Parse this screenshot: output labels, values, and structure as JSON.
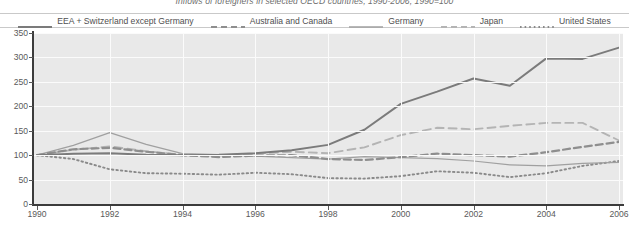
{
  "title": "Inflows of foreigners in selected OECD countries, 1990-2006, 1990=100",
  "legend": {
    "position": "top",
    "items": [
      {
        "label": "EEA + Switzerland except Germany",
        "style": "solid-thick",
        "color": "#7b7b7b"
      },
      {
        "label": "Australia and Canada",
        "style": "dashed-thick",
        "color": "#8e8e8e"
      },
      {
        "label": "Germany",
        "style": "solid-thin",
        "color": "#a0a0a0"
      },
      {
        "label": "Japan",
        "style": "dashed-light",
        "color": "#b4b4b4"
      },
      {
        "label": "United States",
        "style": "dotted",
        "color": "#8a8a8a"
      }
    ]
  },
  "axes": {
    "y_label": "",
    "y_ticks": [
      0,
      50,
      100,
      150,
      200,
      250,
      300,
      350
    ],
    "y_min": 0,
    "y_max": 350,
    "x_label": "",
    "x_ticks": [
      1990,
      1992,
      1994,
      1996,
      1998,
      2000,
      2002,
      2004,
      2006
    ],
    "x_min": 1990,
    "x_max": 2006,
    "grid": true
  },
  "chart_data": {
    "type": "line",
    "title": "Inflows of foreigners in selected OECD countries, 1990-2006, 1990=100",
    "xlabel": "",
    "ylabel": "",
    "ylim": [
      0,
      350
    ],
    "xlim": [
      1990,
      2006
    ],
    "grid": true,
    "legend_position": "top",
    "x": [
      1990,
      1991,
      1992,
      1993,
      1994,
      1995,
      1996,
      1997,
      1998,
      1999,
      2000,
      2001,
      2002,
      2003,
      2004,
      2005,
      2006
    ],
    "series": [
      {
        "name": "EEA + Switzerland except Germany",
        "style": "solid-thick",
        "color": "#7b7b7b",
        "values": [
          100,
          103,
          104,
          101,
          100,
          101,
          104,
          110,
          121,
          152,
          205,
          230,
          257,
          242,
          298,
          297,
          320
        ]
      },
      {
        "name": "Australia and Canada",
        "style": "dashed-thick",
        "color": "#8e8e8e",
        "values": [
          100,
          112,
          115,
          107,
          100,
          96,
          99,
          100,
          92,
          90,
          96,
          103,
          100,
          97,
          106,
          117,
          127
        ]
      },
      {
        "name": "Germany",
        "style": "solid-thin",
        "color": "#a0a0a0",
        "values": [
          100,
          120,
          146,
          122,
          103,
          101,
          98,
          95,
          92,
          97,
          95,
          93,
          88,
          80,
          78,
          83,
          85
        ]
      },
      {
        "name": "Japan",
        "style": "dashed-light",
        "color": "#b4b4b4",
        "values": [
          100,
          111,
          118,
          108,
          101,
          99,
          103,
          107,
          104,
          116,
          141,
          156,
          153,
          160,
          166,
          166,
          130
        ]
      },
      {
        "name": "United States",
        "style": "dotted",
        "color": "#8a8a8a",
        "values": [
          100,
          92,
          71,
          63,
          62,
          60,
          64,
          61,
          53,
          52,
          57,
          67,
          64,
          55,
          63,
          78,
          88
        ]
      }
    ]
  }
}
